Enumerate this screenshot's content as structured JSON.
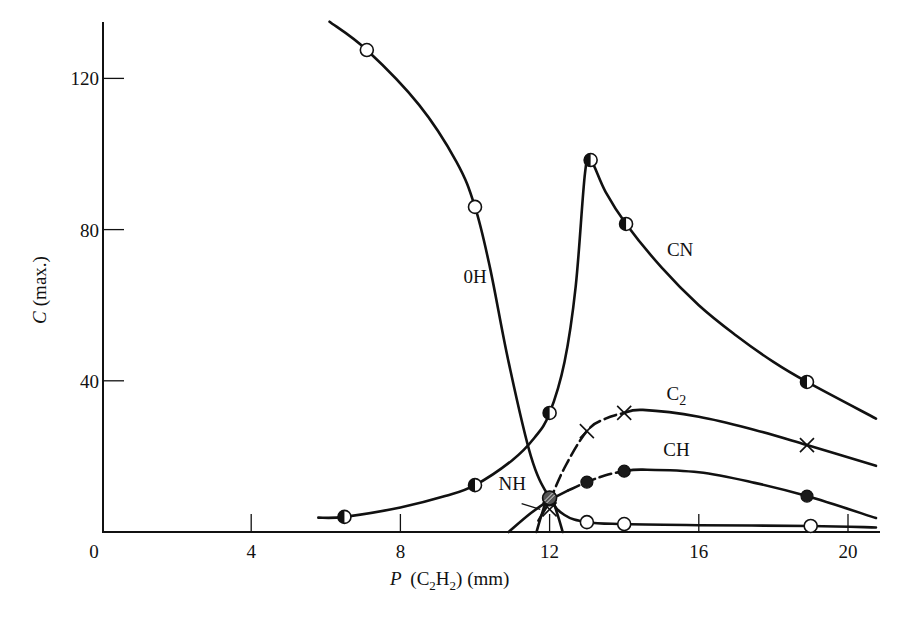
{
  "chart_data": {
    "type": "line",
    "title": "",
    "xlabel": "P (C2H2) (mm)",
    "ylabel": "C (max.)",
    "xlim": [
      0,
      21
    ],
    "ylim": [
      0,
      135
    ],
    "grid": false,
    "legend": "inline curve labels",
    "x_ticks": [
      0,
      4,
      8,
      12,
      16,
      20
    ],
    "y_ticks": [
      40,
      80,
      120
    ],
    "x_tick_labels": [
      "0",
      "4",
      "8",
      "12",
      "16",
      "20"
    ],
    "y_tick_labels": [
      "40",
      "80",
      "120"
    ],
    "series": [
      {
        "name": "OH",
        "label": "0H",
        "marker": "open-circle",
        "points": [
          [
            7.1,
            127.5
          ],
          [
            10.0,
            86
          ],
          [
            12.0,
            9
          ],
          [
            13.0,
            2.6
          ],
          [
            14.0,
            2.1
          ],
          [
            19.0,
            1.6
          ]
        ],
        "curve": [
          [
            6.1,
            135
          ],
          [
            7.1,
            127.5
          ],
          [
            8.5,
            113
          ],
          [
            9.5,
            98
          ],
          [
            10.0,
            86
          ],
          [
            10.4,
            70
          ],
          [
            10.9,
            45
          ],
          [
            11.5,
            20
          ],
          [
            12.0,
            9
          ],
          [
            12.4,
            4.5
          ],
          [
            13.0,
            2.6
          ],
          [
            14.0,
            2.1
          ],
          [
            16,
            1.8
          ],
          [
            19.0,
            1.6
          ],
          [
            20.75,
            1.2
          ]
        ]
      },
      {
        "name": "CN",
        "label": "CN",
        "marker": "half-filled-circle",
        "points": [
          [
            6.5,
            4
          ],
          [
            10.0,
            12.4
          ],
          [
            12.0,
            31.5
          ],
          [
            13.1,
            98.4
          ],
          [
            14.05,
            81.5
          ],
          [
            18.9,
            39.7
          ]
        ],
        "curve": [
          [
            5.8,
            3.8
          ],
          [
            6.5,
            4
          ],
          [
            8,
            6.5
          ],
          [
            9.2,
            9.5
          ],
          [
            10.0,
            12.4
          ],
          [
            11.0,
            19
          ],
          [
            11.6,
            25
          ],
          [
            12.0,
            31.5
          ],
          [
            12.4,
            45
          ],
          [
            12.7,
            65
          ],
          [
            12.95,
            95
          ],
          [
            13.1,
            98.4
          ],
          [
            13.5,
            90
          ],
          [
            14.05,
            81.5
          ],
          [
            15,
            70
          ],
          [
            16,
            60
          ],
          [
            17,
            52
          ],
          [
            18,
            45
          ],
          [
            18.9,
            39.7
          ],
          [
            20.75,
            30
          ]
        ]
      },
      {
        "name": "C2",
        "label": "C2",
        "marker": "x",
        "points": [
          [
            12.0,
            6
          ],
          [
            13.0,
            26.7
          ],
          [
            14.0,
            31.5
          ],
          [
            18.9,
            23
          ]
        ],
        "curve": [
          [
            11.7,
            3
          ],
          [
            12.0,
            8
          ],
          [
            12.4,
            17
          ],
          [
            13.0,
            26.7
          ],
          [
            13.5,
            30
          ],
          [
            14.0,
            31.5
          ],
          [
            14.5,
            32.3
          ],
          [
            16,
            30.5
          ],
          [
            17.5,
            27
          ],
          [
            18.9,
            23
          ],
          [
            20.75,
            17.5
          ]
        ],
        "dashed_segment": [
          11.9,
          14.2
        ]
      },
      {
        "name": "CH",
        "label": "CH",
        "marker": "filled-circle",
        "points": [
          [
            12.0,
            8.5
          ],
          [
            13.0,
            13.2
          ],
          [
            14.0,
            16.1
          ],
          [
            18.9,
            9.5
          ]
        ],
        "curve": [
          [
            10.9,
            0
          ],
          [
            11.5,
            5
          ],
          [
            12.0,
            8.5
          ],
          [
            12.5,
            11
          ],
          [
            13.0,
            13.2
          ],
          [
            13.5,
            15
          ],
          [
            14.0,
            16.1
          ],
          [
            14.5,
            16.5
          ],
          [
            16,
            15.8
          ],
          [
            17.5,
            13
          ],
          [
            18.9,
            9.5
          ],
          [
            20.75,
            3.7
          ]
        ],
        "dashed_segment": [
          12.2,
          14.2
        ]
      },
      {
        "name": "NH",
        "label": "NH",
        "marker": "hatched-circle",
        "points": [
          [
            12.0,
            9
          ]
        ],
        "curve": [
          [
            11.65,
            0
          ],
          [
            11.8,
            5
          ],
          [
            12.0,
            10
          ],
          [
            12.2,
            5
          ],
          [
            12.35,
            0
          ]
        ]
      }
    ],
    "annotations": [
      {
        "text": "0H",
        "x": 10.0,
        "y": 66
      },
      {
        "text": "CN",
        "x": 15.5,
        "y": 73
      },
      {
        "text": "C2",
        "x": 15.4,
        "y": 35
      },
      {
        "text": "CH",
        "x": 15.4,
        "y": 20
      },
      {
        "text": "NH",
        "x": 11.0,
        "y": 11
      }
    ]
  },
  "axes": {
    "x_label_main": "P",
    "x_label_rest": "(C",
    "x_label_sub1": "2",
    "x_label_mid": "H",
    "x_label_sub2": "2",
    "x_label_end": ") (mm)",
    "y_label": "C (max.)",
    "origin_label": "0"
  }
}
